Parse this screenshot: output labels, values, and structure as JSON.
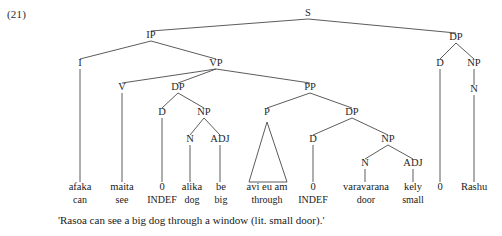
{
  "figure": {
    "example_number": "(21)",
    "translation": "'Rasoa can see a big dog through a window (lit. small door).'",
    "language_note": "Malagasy syntax tree"
  },
  "tree": {
    "nodes": [
      {
        "id": "S",
        "label": "S",
        "x": 308,
        "y": 16
      },
      {
        "id": "IP",
        "label": "IP",
        "x": 151,
        "y": 38
      },
      {
        "id": "DP3",
        "label": "DP",
        "x": 456,
        "y": 40
      },
      {
        "id": "I",
        "label": "I",
        "x": 80,
        "y": 66
      },
      {
        "id": "VP",
        "label": "VP",
        "x": 216,
        "y": 66
      },
      {
        "id": "D3",
        "label": "D",
        "x": 440,
        "y": 66
      },
      {
        "id": "NP3",
        "label": "NP",
        "x": 474,
        "y": 66
      },
      {
        "id": "V",
        "label": "V",
        "x": 122,
        "y": 90
      },
      {
        "id": "DP1",
        "label": "DP",
        "x": 178,
        "y": 90
      },
      {
        "id": "PP",
        "label": "PP",
        "x": 310,
        "y": 90
      },
      {
        "id": "N3",
        "label": "N",
        "x": 474,
        "y": 92
      },
      {
        "id": "D1",
        "label": "D",
        "x": 162,
        "y": 115
      },
      {
        "id": "NP1",
        "label": "NP",
        "x": 204,
        "y": 115
      },
      {
        "id": "P",
        "label": "P",
        "x": 267,
        "y": 115
      },
      {
        "id": "DP2",
        "label": "DP",
        "x": 352,
        "y": 115
      },
      {
        "id": "N1",
        "label": "N",
        "x": 190,
        "y": 142
      },
      {
        "id": "ADJ1",
        "label": "ADJ",
        "x": 220,
        "y": 142
      },
      {
        "id": "D2",
        "label": "D",
        "x": 313,
        "y": 142
      },
      {
        "id": "NP2",
        "label": "NP",
        "x": 388,
        "y": 142
      },
      {
        "id": "N2",
        "label": "N",
        "x": 365,
        "y": 166
      },
      {
        "id": "ADJ2",
        "label": "ADJ",
        "x": 413,
        "y": 166
      }
    ],
    "edges": [
      {
        "from": "S",
        "to": "IP"
      },
      {
        "from": "S",
        "to": "DP3"
      },
      {
        "from": "IP",
        "to": "I"
      },
      {
        "from": "IP",
        "to": "VP"
      },
      {
        "from": "VP",
        "to": "V"
      },
      {
        "from": "VP",
        "to": "DP1"
      },
      {
        "from": "VP",
        "to": "PP"
      },
      {
        "from": "DP1",
        "to": "D1"
      },
      {
        "from": "DP1",
        "to": "NP1"
      },
      {
        "from": "NP1",
        "to": "N1"
      },
      {
        "from": "NP1",
        "to": "ADJ1"
      },
      {
        "from": "PP",
        "to": "P"
      },
      {
        "from": "PP",
        "to": "DP2"
      },
      {
        "from": "DP2",
        "to": "D2"
      },
      {
        "from": "DP2",
        "to": "NP2"
      },
      {
        "from": "NP2",
        "to": "N2"
      },
      {
        "from": "NP2",
        "to": "ADJ2"
      },
      {
        "from": "DP3",
        "to": "D3"
      },
      {
        "from": "DP3",
        "to": "NP3"
      },
      {
        "from": "NP3",
        "to": "N3"
      }
    ],
    "leaf_stems": [
      {
        "from": "I",
        "x": 80,
        "y": 182
      },
      {
        "from": "V",
        "x": 122,
        "y": 182
      },
      {
        "from": "D1",
        "x": 162,
        "y": 182
      },
      {
        "from": "N1",
        "x": 190,
        "y": 182
      },
      {
        "from": "ADJ1",
        "x": 220,
        "y": 182
      },
      {
        "from": "D2",
        "x": 313,
        "y": 182
      },
      {
        "from": "N2",
        "x": 365,
        "y": 182
      },
      {
        "from": "ADJ2",
        "x": 413,
        "y": 182
      },
      {
        "from": "D3",
        "x": 440,
        "y": 182
      },
      {
        "from": "N3",
        "x": 474,
        "y": 182
      }
    ],
    "triangle": {
      "parent": "P",
      "apex_x": 267,
      "apex_y": 122,
      "base_left_x": 249,
      "base_right_x": 287,
      "base_y": 182,
      "covers": "avi eu am"
    }
  },
  "glossed_line": {
    "word_row_y": 190,
    "gloss_row_y": 203,
    "items": [
      {
        "word": "afaka",
        "gloss": "can",
        "x": 80
      },
      {
        "word": "maita",
        "gloss": "see",
        "x": 122
      },
      {
        "word": "0",
        "gloss": "INDEF",
        "x": 162
      },
      {
        "word": "alika",
        "gloss": "dog",
        "x": 192
      },
      {
        "word": "be",
        "gloss": "big",
        "x": 221
      },
      {
        "word": "avi eu am",
        "gloss": "through",
        "x": 267
      },
      {
        "word": "0",
        "gloss": "INDEF",
        "x": 313
      },
      {
        "word": "varavarana",
        "gloss": "door",
        "x": 366
      },
      {
        "word": "kely",
        "gloss": "small",
        "x": 413
      },
      {
        "word": "0",
        "gloss": "",
        "x": 440
      },
      {
        "word": "Rashu",
        "gloss": "",
        "x": 474
      }
    ]
  },
  "colors": {
    "line": "#4a4a4a",
    "text": "#1a1a1a",
    "background": "#ffffff"
  }
}
